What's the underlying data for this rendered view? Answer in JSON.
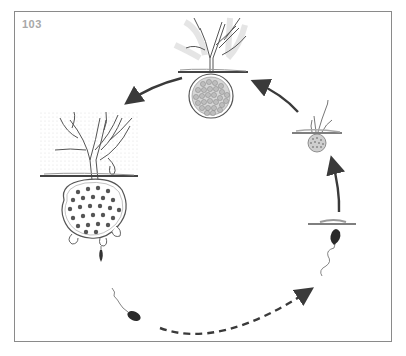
{
  "figure": {
    "number": "103",
    "type": "life-cycle diagram",
    "stages": [
      {
        "id": "mature-sporangium-top",
        "label": "Mature fruiting body with spore-filled sporangium (top)"
      },
      {
        "id": "large-sporangium-left",
        "label": "Large branched thallus with sporangium releasing zoospores (left)"
      },
      {
        "id": "zoospore-left",
        "label": "Released flagellated zoospore (lower left)"
      },
      {
        "id": "zoospore-right",
        "label": "Settling zoospore (lower right)"
      },
      {
        "id": "germling",
        "label": "Encysted spore at substrate surface"
      },
      {
        "id": "young-thallus",
        "label": "Young thallus with small sporangium (right)"
      }
    ],
    "arrows": [
      {
        "from": "zoospore-left",
        "to": "zoospore-right",
        "style": "dashed"
      },
      {
        "from": "germling",
        "to": "young-thallus",
        "style": "solid"
      },
      {
        "from": "young-thallus",
        "to": "mature-sporangium-top",
        "style": "solid"
      },
      {
        "from": "mature-sporangium-top",
        "to": "large-sporangium-left",
        "style": "solid"
      }
    ],
    "colors": {
      "frame": "#8a8a8a",
      "ink": "#3a3a3a",
      "label": "#a8a8a8",
      "spore_fill": "#9a9a9a"
    }
  }
}
